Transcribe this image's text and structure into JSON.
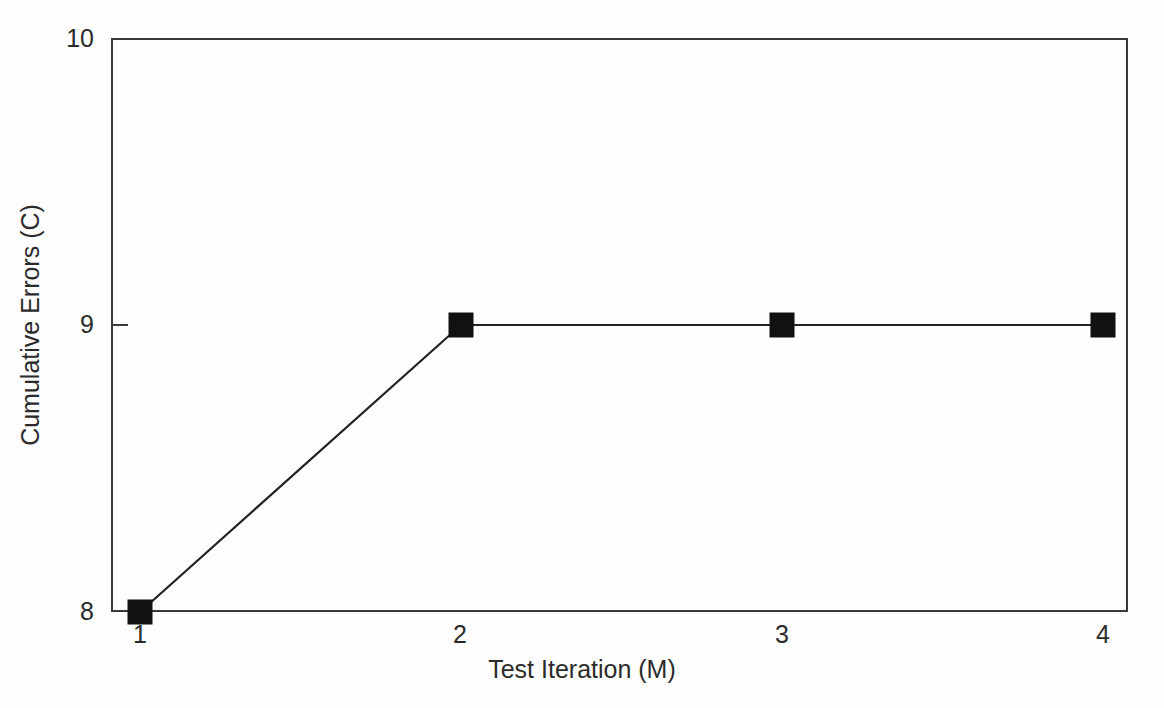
{
  "chart_data": {
    "type": "line",
    "title": "",
    "subtitle": "",
    "xlabel": "Test Iteration (M)",
    "ylabel": "Cumulative Errors (C)",
    "x": [
      1,
      2,
      3,
      4
    ],
    "values": [
      8,
      9,
      9,
      9
    ],
    "series": [
      {
        "name": "Cumulative Errors",
        "values": [
          8,
          9,
          9,
          9
        ],
        "marker": "filled-square",
        "marker_color": "#111111",
        "line_color": "#222222"
      }
    ],
    "xlim": [
      0.82,
      5.0
    ],
    "ylim": [
      8,
      10
    ],
    "xticks": [
      1,
      2,
      3,
      4
    ],
    "xtick_labels": [
      "1",
      "2",
      "3",
      "4"
    ],
    "yticks": [
      8,
      9,
      10
    ],
    "ytick_labels": [
      "8",
      "9",
      "10"
    ],
    "grid": false,
    "legend": null,
    "legend_position": "none",
    "annotations": [],
    "points": [
      {
        "x": 1,
        "y": 8
      },
      {
        "x": 2,
        "y": 9
      },
      {
        "x": 3,
        "y": 9
      },
      {
        "x": 4,
        "y": 9
      }
    ]
  },
  "axes": {
    "y_title": "Cumulative Errors (C)",
    "x_title": "Test Iteration (M)",
    "y_ticks": [
      {
        "label": "10",
        "value": 10
      },
      {
        "label": "9",
        "value": 9
      },
      {
        "label": "8",
        "value": 8
      }
    ],
    "x_ticks": [
      {
        "label": "1",
        "value": 1
      },
      {
        "label": "2",
        "value": 2
      },
      {
        "label": "3",
        "value": 3
      },
      {
        "label": "4",
        "value": 4
      }
    ]
  },
  "colors": {
    "background": "#fefefe",
    "axis": "#3a3a3a",
    "text": "#2b2b2b",
    "line": "#222222",
    "marker": "#111111"
  }
}
